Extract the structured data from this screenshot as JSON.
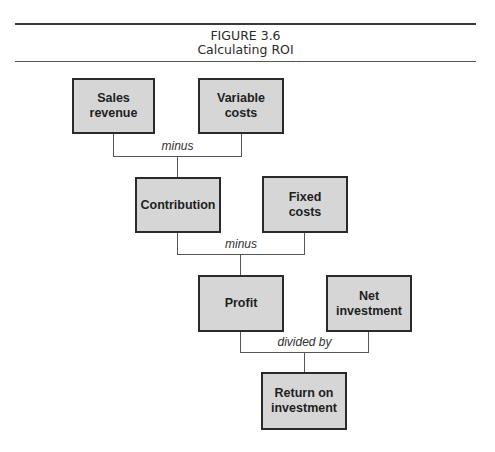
{
  "figure": {
    "number": "FIGURE 3.6",
    "title": "Calculating ROI"
  },
  "nodes": {
    "sales_revenue": "Sales\nrevenue",
    "variable_costs": "Variable\ncosts",
    "contribution": "Contribution",
    "fixed_costs": "Fixed\ncosts",
    "profit": "Profit",
    "net_investment": "Net\ninvestment",
    "roi": "Return on\ninvestment"
  },
  "operators": {
    "op1": "minus",
    "op2": "minus",
    "op3": "divided by"
  },
  "colors": {
    "box_fill": "#d6d6d6",
    "box_border": "#2a2a2a",
    "line": "#555555"
  }
}
